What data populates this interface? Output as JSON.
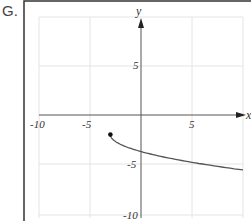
{
  "problem_label": "G.",
  "chart_data": {
    "type": "line",
    "title": "",
    "xlabel": "x",
    "ylabel": "y",
    "xlim": [
      -10,
      10
    ],
    "ylim": [
      -10,
      10
    ],
    "grid": true,
    "x_ticks": [
      "-10",
      "-5",
      "5"
    ],
    "y_ticks": [
      "5",
      "-5",
      "-10"
    ],
    "series": [
      {
        "name": "f(x)",
        "points": [
          [
            -3,
            -2
          ],
          [
            -2,
            -3
          ],
          [
            0,
            -3.73
          ],
          [
            2,
            -4.24
          ],
          [
            4,
            -4.65
          ],
          [
            6,
            -5
          ],
          [
            8,
            -5.32
          ],
          [
            10,
            -5.6
          ]
        ],
        "start_point": {
          "x": -3,
          "y": -2,
          "closed": true
        }
      }
    ]
  }
}
